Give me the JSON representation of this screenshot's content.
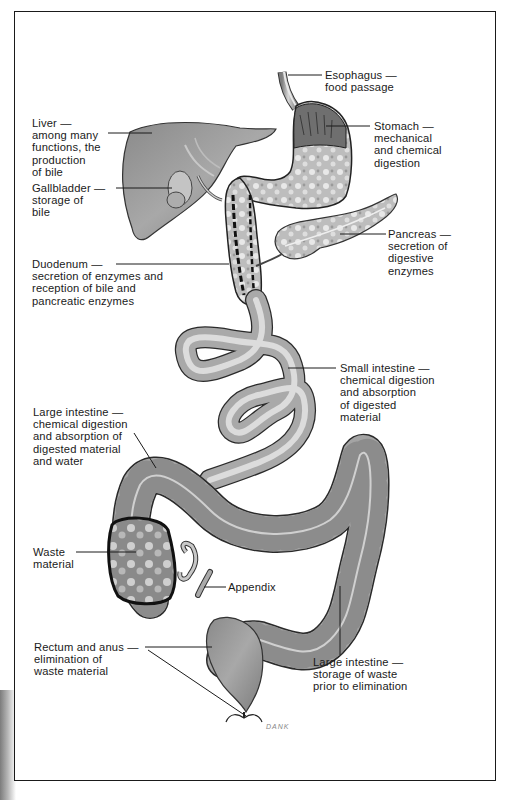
{
  "diagram": {
    "title": "",
    "type": "digestive-system-illustration",
    "signature": "DANK",
    "labels": [
      {
        "id": "esophagus",
        "text": "Esophagus —\nfood passage"
      },
      {
        "id": "stomach",
        "text": "Stomach —\nmechanical\nand chemical\ndigestion"
      },
      {
        "id": "liver",
        "text": "Liver —\namong many\nfunctions, the\nproduction\nof bile"
      },
      {
        "id": "gallbladder",
        "text": "Gallbladder —\nstorage of\nbile"
      },
      {
        "id": "pancreas",
        "text": "Pancreas —\nsecretion of\ndigestive\nenzymes"
      },
      {
        "id": "duodenum",
        "text": "Duodenum —\nsecretion of enzymes and\nreception of bile and\npancreatic enzymes"
      },
      {
        "id": "small-intestine",
        "text": "Small intestine —\nchemical digestion\nand absorption\nof digested\nmaterial"
      },
      {
        "id": "large-intestine-absorption",
        "text": "Large intestine —\nchemical digestion\nand absorption of\ndigested material\nand water"
      },
      {
        "id": "waste-material",
        "text": "Waste\nmaterial"
      },
      {
        "id": "appendix",
        "text": "Appendix"
      },
      {
        "id": "rectum-anus",
        "text": "Rectum and anus —\nelimination of\nwaste material"
      },
      {
        "id": "large-intestine-storage",
        "text": "Large intestine —\nstorage of waste\nprior to elimination"
      }
    ]
  },
  "colors": {
    "organ_fill": "#9a9a9a",
    "organ_light": "#c9c9c9",
    "organ_dark": "#5e5e5e",
    "outline": "#222222",
    "text": "#1a1a1a",
    "background": "#ffffff"
  }
}
